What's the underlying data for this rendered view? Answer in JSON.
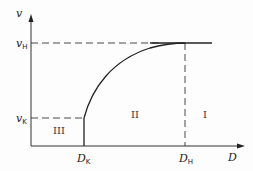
{
  "diagram": {
    "axes": {
      "y_label": "v",
      "x_label": "D"
    },
    "levels": {
      "v_high": {
        "symbol": "v",
        "subscript": "H"
      },
      "v_low": {
        "symbol": "v",
        "subscript": "K"
      }
    },
    "ticks": {
      "d_low": {
        "symbol": "D",
        "subscript": "K"
      },
      "d_high": {
        "symbol": "D",
        "subscript": "H"
      }
    },
    "regions": [
      {
        "id": "region-3",
        "label": "III"
      },
      {
        "id": "region-2",
        "label": "II"
      },
      {
        "id": "region-1",
        "label": "I"
      }
    ],
    "colors": {
      "line": "#222222",
      "background": "#fdfdfd"
    }
  }
}
